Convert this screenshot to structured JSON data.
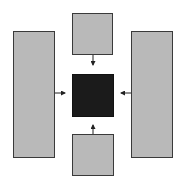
{
  "diagram": {
    "type": "block-flow",
    "colors": {
      "block_fill": "#b9b9b9",
      "block_border": "#3a3a3a",
      "center_fill": "#1b1b1b",
      "arrow": "#222222",
      "background": "#ffffff"
    },
    "nodes": [
      {
        "id": "left",
        "shape": "tall-rectangle",
        "fill": "gray"
      },
      {
        "id": "top",
        "shape": "square",
        "fill": "gray"
      },
      {
        "id": "right",
        "shape": "tall-rectangle",
        "fill": "gray"
      },
      {
        "id": "bottom",
        "shape": "square",
        "fill": "gray"
      },
      {
        "id": "center",
        "shape": "square",
        "fill": "black"
      }
    ],
    "edges": [
      {
        "from": "left",
        "to": "center"
      },
      {
        "from": "top",
        "to": "center"
      },
      {
        "from": "right",
        "to": "center"
      },
      {
        "from": "bottom",
        "to": "center"
      }
    ]
  }
}
